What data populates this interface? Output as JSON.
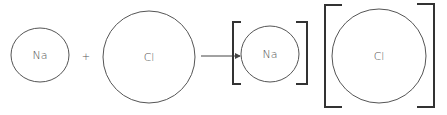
{
  "diagram": {
    "title": "",
    "colors": {
      "stroke": "#555555",
      "bracket": "#333333",
      "text": "#555555"
    },
    "reactants": [
      {
        "symbol": "Na"
      },
      {
        "symbol": "Cl"
      }
    ],
    "operator": "+",
    "products": [
      {
        "symbol": "Na"
      },
      {
        "symbol": "Cl"
      }
    ]
  }
}
